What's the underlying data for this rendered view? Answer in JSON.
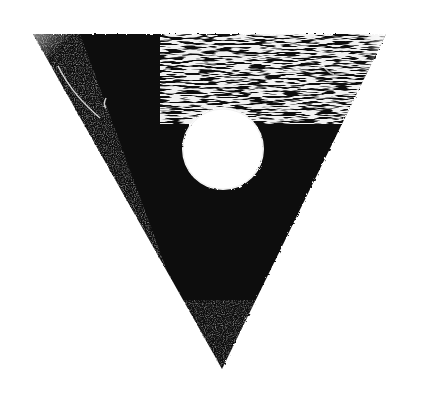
{
  "image": {
    "width": 423,
    "height": 410,
    "background": "#ffffff",
    "ink": "#0d0d0d",
    "subject": "inverted black triangle with white circle, textured print"
  },
  "triangle": {
    "top_left": [
      33,
      34
    ],
    "top_right": [
      386,
      34
    ],
    "apex": [
      222,
      369
    ]
  },
  "circle": {
    "cx": 223,
    "cy": 149,
    "r": 41,
    "fill": "#ffffff"
  }
}
